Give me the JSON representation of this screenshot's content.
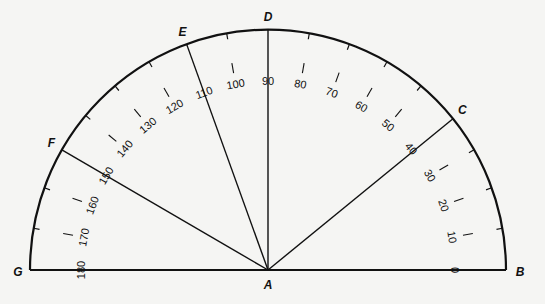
{
  "diagram": {
    "center_point": {
      "label": "A",
      "x": 268,
      "y": 270
    },
    "radius": 238,
    "degree_labels": [
      0,
      10,
      20,
      30,
      40,
      50,
      60,
      70,
      80,
      90,
      100,
      110,
      120,
      130,
      140,
      150,
      160,
      170,
      180
    ],
    "arc_ticks_deg": [
      10,
      20,
      30,
      50,
      60,
      70,
      80,
      100,
      120,
      130,
      140,
      160,
      170
    ],
    "points": [
      {
        "label": "B",
        "angle": 0
      },
      {
        "label": "C",
        "angle": 39
      },
      {
        "label": "D",
        "angle": 90
      },
      {
        "label": "E",
        "angle": 110
      },
      {
        "label": "F",
        "angle": 150
      },
      {
        "label": "G",
        "angle": 180
      }
    ],
    "rays": [
      {
        "from": "A",
        "to": "C",
        "angle": 39
      },
      {
        "from": "A",
        "to": "D",
        "angle": 90
      },
      {
        "from": "A",
        "to": "E",
        "angle": 110
      },
      {
        "from": "A",
        "to": "F",
        "angle": 150
      }
    ],
    "stroke_color": "#111111",
    "background_color": "#f5f5f3"
  }
}
